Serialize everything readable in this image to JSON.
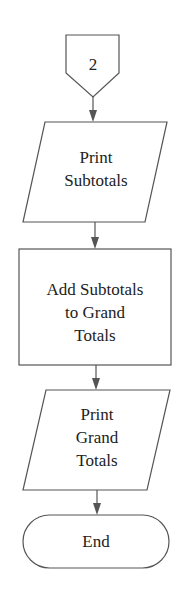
{
  "diagram": {
    "type": "flowchart",
    "connector": {
      "label": "2",
      "shape": "off-page-connector"
    },
    "nodes": [
      {
        "id": "print-subtotals",
        "shape": "parallelogram",
        "lines": [
          "Print",
          "Subtotals"
        ]
      },
      {
        "id": "add-subtotals",
        "shape": "rectangle",
        "lines": [
          "Add Subtotals",
          "to Grand",
          "Totals"
        ]
      },
      {
        "id": "print-grand-totals",
        "shape": "parallelogram",
        "lines": [
          "Print",
          "Grand",
          "Totals"
        ]
      },
      {
        "id": "end",
        "shape": "terminator",
        "lines": [
          "End"
        ]
      }
    ],
    "colors": {
      "stroke": "#555555",
      "text": "#222222",
      "background": "#ffffff"
    }
  }
}
